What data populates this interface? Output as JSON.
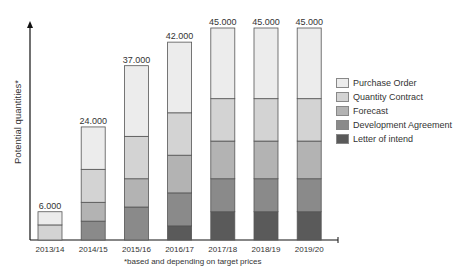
{
  "chart_data": {
    "type": "bar",
    "stacked": true,
    "title": "",
    "xlabel": "",
    "ylabel": "Potential quantities*",
    "footnote": "*based and depending on target prices",
    "categories": [
      "2013/14",
      "2014/15",
      "2015/16",
      "2016/17",
      "2017/18",
      "2018/19",
      "2019/20"
    ],
    "totals_labels": [
      "6.000",
      "24.000",
      "37.000",
      "42.000",
      "45.000",
      "45.000",
      "45.000"
    ],
    "series": [
      {
        "name": "Letter of intend",
        "color": "#5a5a5a",
        "values": [
          0,
          0,
          0,
          3000,
          6000,
          6000,
          6000
        ]
      },
      {
        "name": "Development Agreement",
        "color": "#8a8a8a",
        "values": [
          0,
          4000,
          7000,
          7000,
          7000,
          7000,
          7000
        ]
      },
      {
        "name": "Forecast",
        "color": "#b3b3b3",
        "values": [
          0,
          4000,
          6000,
          8000,
          8000,
          8000,
          8000
        ]
      },
      {
        "name": "Quantity Contract",
        "color": "#d3d3d3",
        "values": [
          3200,
          7000,
          9000,
          9000,
          9000,
          9000,
          9000
        ]
      },
      {
        "name": "Purchase Order",
        "color": "#ececec",
        "values": [
          2800,
          9000,
          15000,
          15000,
          15000,
          15000,
          15000
        ]
      }
    ],
    "legend_order": [
      "Purchase Order",
      "Quantity Contract",
      "Forecast",
      "Development Agreement",
      "Letter of intend"
    ],
    "ylim": [
      0,
      45000
    ],
    "grid": false,
    "y_ticks_shown": false,
    "legend_position": "right"
  }
}
